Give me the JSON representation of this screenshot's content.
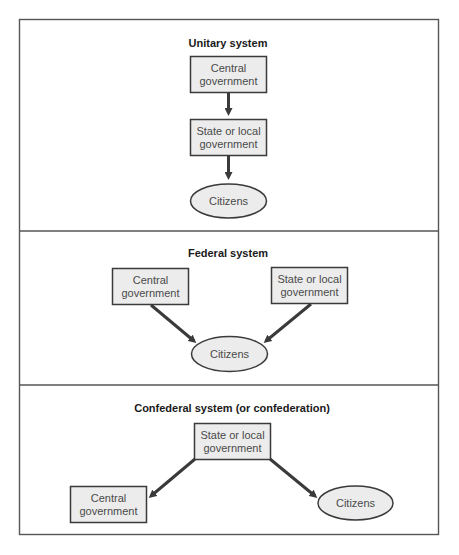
{
  "sections": [
    {
      "title": "Unitary system",
      "nodes": {
        "central": [
          "Central",
          "government"
        ],
        "state": [
          "State or local",
          "government"
        ],
        "citizens": "Citizens"
      }
    },
    {
      "title": "Federal system",
      "nodes": {
        "central": [
          "Central",
          "government"
        ],
        "state": [
          "State or local",
          "government"
        ],
        "citizens": "Citizens"
      }
    },
    {
      "title": "Confederal system (or confederation)",
      "nodes": {
        "state": [
          "State or local",
          "government"
        ],
        "central": [
          "Central",
          "government"
        ],
        "citizens": "Citizens"
      }
    }
  ],
  "colors": {
    "node_fill": "#ececec",
    "stroke": "#3a3a3a",
    "frame": "#555555"
  }
}
